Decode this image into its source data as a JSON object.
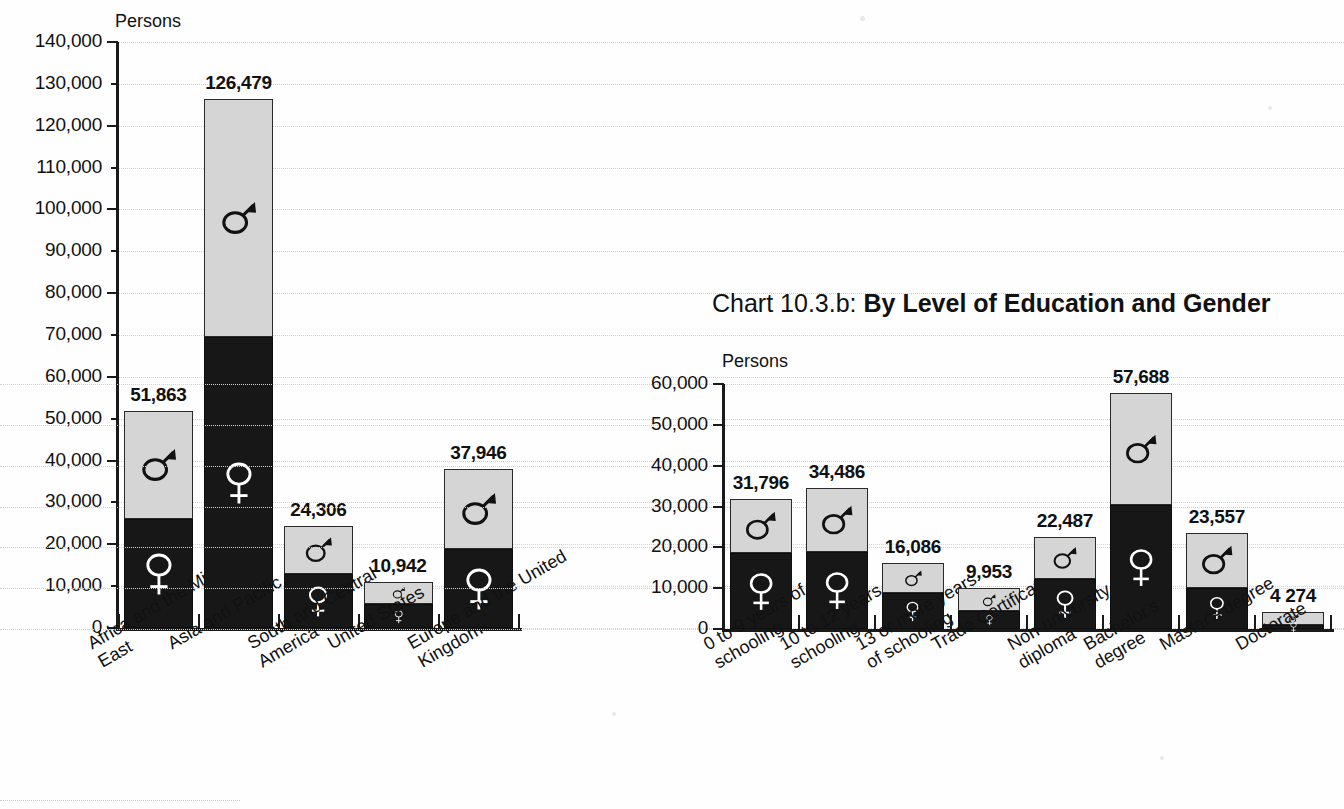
{
  "page": {
    "y_axis_unit_label": "Persons"
  },
  "chart_b_title": {
    "number": "Chart 10.3.b",
    "separator": ": ",
    "main": "By Level of Education and Gender"
  },
  "chart_data": [
    {
      "id": "by-region-and-gender",
      "type": "bar",
      "stacked": true,
      "title": "",
      "xlabel": "",
      "ylabel": "Persons",
      "ylim": [
        0,
        140000
      ],
      "ytick_labels": [
        "0",
        "10,000",
        "20,000",
        "30,000",
        "40,000",
        "50,000",
        "60,000",
        "70,000",
        "80,000",
        "90,000",
        "100,000",
        "110,000",
        "120,000",
        "130,000",
        "140,000"
      ],
      "ytick_values": [
        0,
        10000,
        20000,
        30000,
        40000,
        50000,
        60000,
        70000,
        80000,
        90000,
        100000,
        110000,
        120000,
        130000,
        140000
      ],
      "grid": true,
      "legend": "in-bar gender symbols",
      "categories": [
        "Africa and the Middle\nEast",
        "Asia and Pacific",
        "South and Central\nAmerica",
        "United States",
        "Europe and the United\nKingdom"
      ],
      "series": [
        {
          "name": "Female",
          "symbol": "female",
          "values": [
            26000,
            69500,
            13000,
            5700,
            18800
          ]
        },
        {
          "name": "Male",
          "symbol": "male",
          "values": [
            25863,
            56979,
            11306,
            5242,
            19146
          ]
        }
      ],
      "totals": [
        51863,
        126479,
        24306,
        10942,
        37946
      ],
      "total_labels": [
        "51,863",
        "126,479",
        "24,306",
        "10,942",
        "37,946"
      ]
    },
    {
      "id": "by-level-of-education-and-gender",
      "type": "bar",
      "stacked": true,
      "title": "Chart 10.3.b: By Level of Education and Gender",
      "xlabel": "",
      "ylabel": "Persons",
      "ylim": [
        0,
        60000
      ],
      "ytick_labels": [
        "0",
        "10,000",
        "20,000",
        "30,000",
        "40,000",
        "50,000",
        "60,000"
      ],
      "ytick_values": [
        0,
        10000,
        20000,
        30000,
        40000,
        50000,
        60000
      ],
      "grid": true,
      "legend": "in-bar gender symbols",
      "categories": [
        "0 to 9 years of\nschooling",
        "10 to 12 years of\nschooling",
        "13 or more years\nof schooling",
        "Trade Certificate",
        "Non-university\ndiploma",
        "Bachelor's\ndegree",
        "Master's degree",
        "Doctorate"
      ],
      "series": [
        {
          "name": "Female",
          "symbol": "female",
          "values": [
            18600,
            18800,
            8700,
            4300,
            12300,
            30400,
            10100,
            900
          ]
        },
        {
          "name": "Male",
          "symbol": "male",
          "values": [
            13196,
            15686,
            7386,
            5653,
            10187,
            27288,
            13457,
            3374
          ]
        }
      ],
      "totals": [
        31796,
        34486,
        16086,
        9953,
        22487,
        57688,
        23557,
        4274
      ],
      "total_labels": [
        "31,796",
        "34,486",
        "16,086",
        "9,953",
        "22,487",
        "57,688",
        "23,557",
        "4 274"
      ]
    }
  ],
  "colors": {
    "female_segment": "#171717",
    "male_segment": "#d5d5d5",
    "axis": "#1a1a1a",
    "gridline": "#d2d2d2",
    "background": "#fefefe",
    "text": "#111111"
  }
}
